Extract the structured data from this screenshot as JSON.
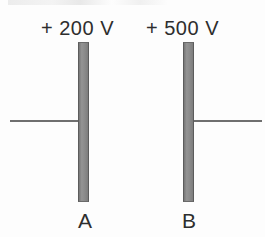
{
  "figure": {
    "type": "physics-diagram",
    "plates": [
      {
        "id": "A",
        "letter_label": "A",
        "voltage_label": "+ 200 V",
        "voltage_value": 200,
        "voltage_unit": "V",
        "polarity": "+",
        "wire_side": "left"
      },
      {
        "id": "B",
        "letter_label": "B",
        "voltage_label": "+ 500 V",
        "voltage_value": 500,
        "voltage_unit": "V",
        "polarity": "+",
        "wire_side": "right"
      }
    ],
    "colors": {
      "plate_fill": "#8d8d8d",
      "plate_edge": "#5c5c5c",
      "wire": "#6f6f6f",
      "text": "#2e2e2e",
      "background": "#fdfdfd"
    }
  }
}
